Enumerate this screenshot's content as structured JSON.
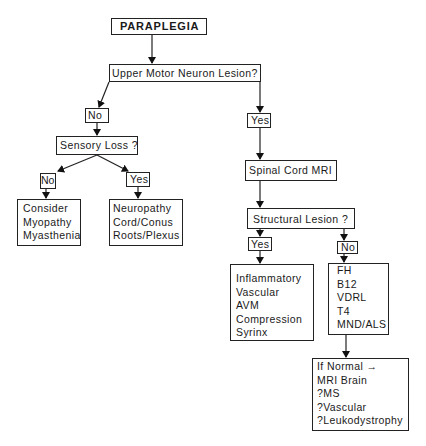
{
  "diagram": {
    "title": "PARAPLEGIA",
    "nodes": {
      "root": {
        "label": "PARAPLEGIA"
      },
      "umn_question": {
        "label": "Upper Motor Neuron Lesion?"
      },
      "umn_no": {
        "label": "No"
      },
      "umn_yes": {
        "label": "Yes"
      },
      "sensory_question": {
        "label": "Sensory Loss ?"
      },
      "sensory_no": {
        "label": "No"
      },
      "sensory_yes": {
        "label": "Yes"
      },
      "consider": {
        "lines": [
          "Consider",
          "Myopathy",
          "Myasthenia"
        ]
      },
      "neuropathy": {
        "lines": [
          "Neuropathy",
          "Cord/Conus",
          "Roots/Plexus"
        ]
      },
      "spinal_mri": {
        "label": "Spinal Cord MRI"
      },
      "structural_question": {
        "label": "Structural Lesion ?"
      },
      "structural_yes": {
        "label": "Yes"
      },
      "structural_no": {
        "label": "No"
      },
      "structural_causes": {
        "lines": [
          "Inflammatory",
          "Vascular",
          "AVM",
          "Compression",
          "Syrinx"
        ]
      },
      "tests": {
        "lines": [
          "FH",
          "B12",
          "VDRL",
          "T4",
          "MND/ALS"
        ]
      },
      "if_normal": {
        "lines": [
          "If Normal →",
          "MRI Brain",
          "?MS",
          "?Vascular",
          "?Leukodystrophy"
        ]
      }
    },
    "edges": [
      {
        "from": "PARAPLEGIA",
        "to": "Upper Motor Neuron Lesion?"
      },
      {
        "from": "Upper Motor Neuron Lesion?",
        "to": "No"
      },
      {
        "from": "Upper Motor Neuron Lesion?",
        "to": "Yes"
      },
      {
        "from": "No",
        "to": "Sensory Loss ?"
      },
      {
        "from": "Sensory Loss ?",
        "to": "No"
      },
      {
        "from": "Sensory Loss ?",
        "to": "Yes"
      },
      {
        "from": "No",
        "to": "Consider Myopathy Myasthenia"
      },
      {
        "from": "Yes",
        "to": "Neuropathy Cord/Conus Roots/Plexus"
      },
      {
        "from": "Yes",
        "to": "Spinal Cord MRI"
      },
      {
        "from": "Spinal Cord MRI",
        "to": "Structural Lesion ?"
      },
      {
        "from": "Structural Lesion ?",
        "to": "Yes"
      },
      {
        "from": "Structural Lesion ?",
        "to": "No"
      },
      {
        "from": "Yes",
        "to": "Inflammatory Vascular AVM Compression Syrinx"
      },
      {
        "from": "No",
        "to": "FH B12 VDRL T4 MND/ALS"
      },
      {
        "from": "FH B12 VDRL T4 MND/ALS",
        "to": "If Normal MRI Brain"
      }
    ]
  }
}
